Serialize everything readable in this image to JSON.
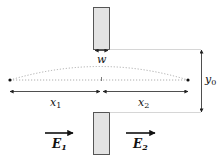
{
  "diagram": {
    "type": "slit-geometry",
    "labels": {
      "width": "w",
      "height": "y",
      "height_sub": "0",
      "x_left": "x",
      "x_left_sub": "1",
      "x_right": "x",
      "x_right_sub": "2",
      "field_in": "E",
      "field_in_sub": "1",
      "field_out": "E",
      "field_out_sub": "2"
    },
    "colors": {
      "screen_fill": "#e3e3e3",
      "screen_stroke": "#555555",
      "line": "#222222",
      "dotted": "#999999"
    }
  }
}
